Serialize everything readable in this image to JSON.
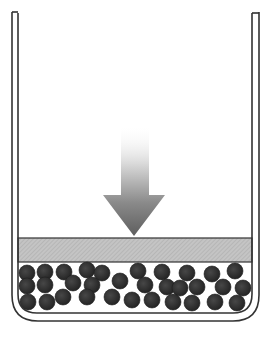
{
  "diagram": {
    "title": "",
    "colors": {
      "background": "#ffffff",
      "outline": "#333333",
      "hatch_band": "#bdbdbd",
      "particle": "#2e2e2e",
      "arrow_dark": "#6a6a6a",
      "arrow_light": "#ffffff"
    },
    "container": {
      "outer": {
        "left": 12,
        "right": 259,
        "top": 12,
        "bottom": 321,
        "radius": 26
      },
      "inner": {
        "left": 18,
        "right": 252,
        "top": 13,
        "bottom": 313,
        "radius": 19
      }
    },
    "layer": {
      "top": 238,
      "bottom": 262,
      "left": 18,
      "right": 252
    },
    "arrow": {
      "direction": "down",
      "shaft_left": 121,
      "shaft_right": 149,
      "shaft_top": 125,
      "head_top": 195,
      "head_left": 103,
      "head_right": 165,
      "tip_x": 134,
      "tip_y": 236
    },
    "particle_radius": 8,
    "particles": [
      [
        27,
        273
      ],
      [
        45,
        272
      ],
      [
        64,
        272
      ],
      [
        87,
        270
      ],
      [
        102,
        273
      ],
      [
        138,
        271
      ],
      [
        162,
        272
      ],
      [
        187,
        273
      ],
      [
        212,
        274
      ],
      [
        235,
        271
      ],
      [
        27,
        286
      ],
      [
        45,
        285
      ],
      [
        73,
        283
      ],
      [
        92,
        285
      ],
      [
        120,
        281
      ],
      [
        145,
        285
      ],
      [
        167,
        287
      ],
      [
        180,
        288
      ],
      [
        197,
        287
      ],
      [
        223,
        287
      ],
      [
        243,
        288
      ],
      [
        28,
        302
      ],
      [
        47,
        302
      ],
      [
        63,
        297
      ],
      [
        87,
        297
      ],
      [
        112,
        297
      ],
      [
        132,
        300
      ],
      [
        152,
        300
      ],
      [
        173,
        302
      ],
      [
        192,
        303
      ],
      [
        215,
        302
      ],
      [
        237,
        303
      ]
    ]
  }
}
